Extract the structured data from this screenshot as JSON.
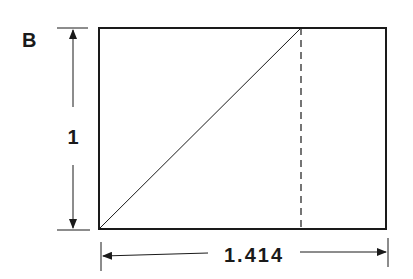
{
  "figure": {
    "panel_label": "B",
    "height_label": "1",
    "width_label": "1.414",
    "shape": "rectangle with diagonal of unit square and dashed square boundary",
    "colors": {
      "stroke": "#1a1a1a",
      "background": "#ffffff"
    }
  }
}
